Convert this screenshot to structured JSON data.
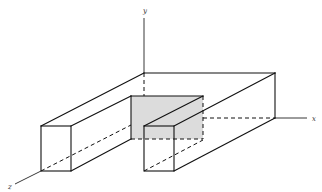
{
  "figure": {
    "type": "3D isometric line drawing",
    "shaded_face_color": "#dcdcdc",
    "line_color": "#111111"
  },
  "axes": {
    "x_label": "x",
    "y_label": "y",
    "z_label": "z"
  }
}
